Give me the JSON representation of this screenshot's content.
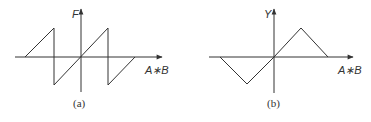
{
  "panels": [
    {
      "id": "a",
      "caption": "(a)",
      "y_axis_label": "F",
      "x_axis_label": "A∗B",
      "shape": "sawtooth",
      "polyline": "25,57 54,28 54,85 108,28 108,85 135,57"
    },
    {
      "id": "b",
      "caption": "(b)",
      "y_axis_label": "Y",
      "x_axis_label": "A∗B",
      "shape": "triangle",
      "polyline": "220,57 247,84 274,57 301,28 328,57"
    }
  ],
  "colors": {
    "stroke": "#333333",
    "background": "#ffffff"
  }
}
